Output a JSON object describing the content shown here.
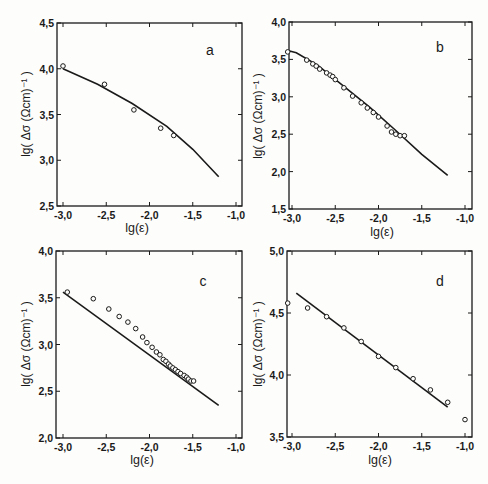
{
  "figure": {
    "xlabel": "lg(ε)",
    "ylabel": "lg( Δσ (Ωcm)⁻¹ )"
  },
  "chart_data": [
    {
      "panel": "a",
      "type": "scatter",
      "title": "a",
      "xlabel": "lg(ε)",
      "ylabel": "lg( Δσ (Ωcm)^-1 )",
      "xlim": [
        -3.1,
        -0.95
      ],
      "ylim": [
        2.5,
        4.5
      ],
      "xticks": [
        "-3,0",
        "-2,5",
        "-2,0",
        "-1,5",
        "-1,0"
      ],
      "yticks": [
        "2,5",
        "3,0",
        "3,5",
        "4,0",
        "4,5"
      ],
      "xtick_values": [
        -3.0,
        -2.5,
        -2.0,
        -1.5,
        -1.0
      ],
      "ytick_values": [
        2.5,
        3.0,
        3.5,
        4.0,
        4.5
      ],
      "points": {
        "x": [
          -3.0,
          -2.52,
          -2.18,
          -1.87,
          -1.72
        ],
        "y": [
          4.03,
          3.83,
          3.55,
          3.35,
          3.27
        ]
      },
      "fit_line": {
        "x": [
          -3.0,
          -2.6,
          -2.2,
          -1.8,
          -1.5,
          -1.2
        ],
        "y": [
          4.0,
          3.83,
          3.62,
          3.37,
          3.12,
          2.82
        ]
      },
      "grid": false
    },
    {
      "panel": "b",
      "type": "scatter",
      "title": "b",
      "xlabel": "lg(ε)",
      "ylabel": "lg( Δσ (Ωcm)^-1 )",
      "xlim": [
        -3.1,
        -0.9
      ],
      "ylim": [
        1.5,
        4.0
      ],
      "xticks": [
        "-3,0",
        "-2,5",
        "-2,0",
        "-1,5",
        "-1,0"
      ],
      "yticks": [
        "1,5",
        "2,0",
        "2,5",
        "3,0",
        "3,5",
        "4,0"
      ],
      "xtick_values": [
        -3.0,
        -2.5,
        -2.0,
        -1.5,
        -1.0
      ],
      "ytick_values": [
        1.5,
        2.0,
        2.5,
        3.0,
        3.5,
        4.0
      ],
      "points": {
        "x": [
          -3.05,
          -2.83,
          -2.76,
          -2.72,
          -2.68,
          -2.6,
          -2.56,
          -2.53,
          -2.5,
          -2.4,
          -2.3,
          -2.2,
          -2.13,
          -2.06,
          -2.0,
          -1.9,
          -1.85,
          -1.8,
          -1.75,
          -1.7
        ],
        "y": [
          3.6,
          3.49,
          3.44,
          3.41,
          3.37,
          3.32,
          3.29,
          3.27,
          3.23,
          3.12,
          3.01,
          2.92,
          2.85,
          2.79,
          2.73,
          2.61,
          2.53,
          2.5,
          2.48,
          2.48
        ]
      },
      "fit_line": {
        "x": [
          -3.05,
          -2.95,
          -2.7,
          -2.4,
          -2.1,
          -1.8,
          -1.5,
          -1.2
        ],
        "y": [
          3.62,
          3.59,
          3.42,
          3.14,
          2.86,
          2.55,
          2.23,
          1.95
        ]
      },
      "grid": false
    },
    {
      "panel": "c",
      "type": "scatter",
      "title": "c",
      "xlabel": "lg(ε)",
      "ylabel": "lg( Δσ (Ωcm)^-1 )",
      "xlim": [
        -3.1,
        -0.95
      ],
      "ylim": [
        2.0,
        4.0
      ],
      "xticks": [
        "-3,0",
        "-2,5",
        "-2,0",
        "-1,5",
        "-1,0"
      ],
      "yticks": [
        "2,0",
        "2,5",
        "3,0",
        "3,5",
        "4,0"
      ],
      "xtick_values": [
        -3.0,
        -2.5,
        -2.0,
        -1.5,
        -1.0
      ],
      "ytick_values": [
        2.0,
        2.5,
        3.0,
        3.5,
        4.0
      ],
      "points": {
        "x": [
          -2.95,
          -2.65,
          -2.47,
          -2.35,
          -2.25,
          -2.16,
          -2.08,
          -2.03,
          -1.97,
          -1.92,
          -1.88,
          -1.84,
          -1.81,
          -1.78,
          -1.76,
          -1.73,
          -1.7,
          -1.67,
          -1.64,
          -1.6,
          -1.57,
          -1.55,
          -1.52,
          -1.49
        ],
        "y": [
          3.56,
          3.49,
          3.38,
          3.3,
          3.24,
          3.17,
          3.08,
          3.02,
          2.97,
          2.92,
          2.89,
          2.84,
          2.82,
          2.79,
          2.77,
          2.75,
          2.73,
          2.71,
          2.69,
          2.67,
          2.65,
          2.63,
          2.61,
          2.61
        ]
      },
      "fit_line": {
        "x": [
          -3.0,
          -1.2
        ],
        "y": [
          3.56,
          2.35
        ]
      },
      "grid": false
    },
    {
      "panel": "d",
      "type": "scatter",
      "title": "d",
      "xlabel": "lg(ε)",
      "ylabel": "lg( Δσ (Ωcm)^-1 )",
      "xlim": [
        -3.1,
        -0.9
      ],
      "ylim": [
        3.5,
        5.0
      ],
      "xticks": [
        "-3,0",
        "-2,5",
        "-2,0",
        "-1,5",
        "-1,0"
      ],
      "yticks": [
        "3,5",
        "4,0",
        "4,5",
        "5,0"
      ],
      "xtick_values": [
        -3.0,
        -2.5,
        -2.0,
        -1.5,
        -1.0
      ],
      "ytick_values": [
        3.5,
        4.0,
        4.5,
        5.0
      ],
      "points": {
        "x": [
          -3.05,
          -2.82,
          -2.6,
          -2.4,
          -2.2,
          -2.0,
          -1.8,
          -1.6,
          -1.4,
          -1.2,
          -1.0
        ],
        "y": [
          4.58,
          4.54,
          4.47,
          4.38,
          4.27,
          4.15,
          4.06,
          3.97,
          3.88,
          3.78,
          3.64
        ]
      },
      "fit_line": {
        "x": [
          -2.95,
          -1.2
        ],
        "y": [
          4.66,
          3.74
        ]
      },
      "grid": false
    }
  ]
}
